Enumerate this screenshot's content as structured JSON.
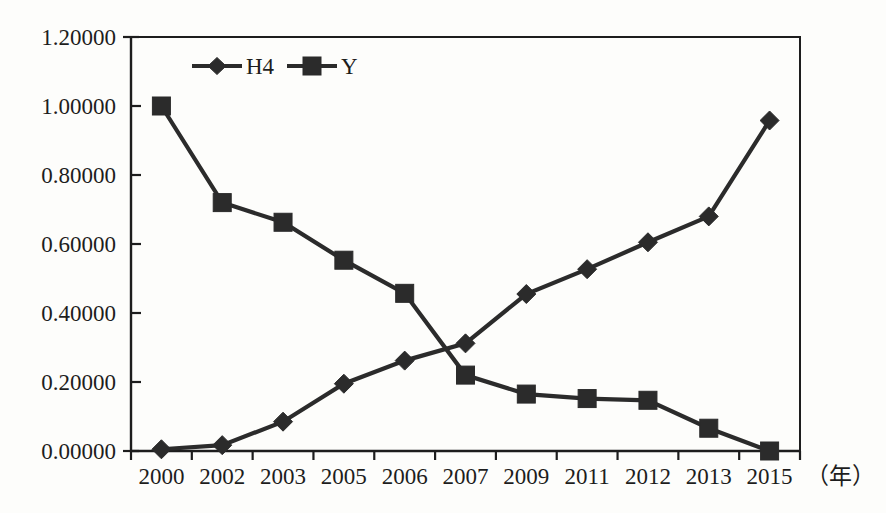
{
  "chart_data": {
    "type": "line",
    "title": "",
    "subtitle": "",
    "xlabel": "（年）",
    "ylabel": "",
    "categories": [
      "2000",
      "2002",
      "2003",
      "2005",
      "2006",
      "2007",
      "2009",
      "2011",
      "2012",
      "2013",
      "2015"
    ],
    "series": [
      {
        "name": "H4",
        "marker": "diamond",
        "color": "#2b2b2b",
        "values": [
          0.005,
          0.017,
          0.085,
          0.195,
          0.262,
          0.312,
          0.455,
          0.527,
          0.605,
          0.68,
          0.958
        ]
      },
      {
        "name": "Y",
        "marker": "square",
        "color": "#2b2b2b",
        "values": [
          1.0,
          0.72,
          0.663,
          0.553,
          0.457,
          0.22,
          0.165,
          0.152,
          0.147,
          0.066,
          0.0
        ]
      }
    ],
    "ylim": [
      0.0,
      1.2
    ],
    "ytick_values": [
      0.0,
      0.2,
      0.4,
      0.6,
      0.8,
      1.0,
      1.2
    ],
    "ytick_labels": [
      "0.00000",
      "0.20000",
      "0.40000",
      "0.60000",
      "0.80000",
      "1.00000",
      "1.20000"
    ],
    "grid": false,
    "legend_position": "top-left-inside",
    "annotations": []
  },
  "legend": {
    "entries": [
      {
        "label": "H4",
        "marker": "diamond"
      },
      {
        "label": "Y",
        "marker": "square"
      }
    ]
  },
  "axes": {
    "x_unit_note": "（年）"
  },
  "colors": {
    "ink": "#1d1d1d",
    "series": "#2b2b2b",
    "background": "#fdfdfb"
  }
}
